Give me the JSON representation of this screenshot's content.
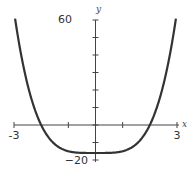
{
  "chart_data": {
    "type": "line",
    "title": "",
    "xlabel": "x",
    "ylabel": "y",
    "xlim": [
      -3,
      3
    ],
    "ylim": [
      -20,
      60
    ],
    "x_tick_labels": [
      "-3",
      "3"
    ],
    "y_tick_labels": [
      "60",
      "-20"
    ],
    "x_ticks": [
      -3,
      -1,
      1,
      3
    ],
    "y_ticks": [
      -20,
      -10,
      0,
      10,
      20,
      30,
      40,
      50,
      60
    ],
    "grid": false,
    "series": [
      {
        "name": "y = x^4 - 16",
        "x": [
          -2.9,
          -2.5,
          -2,
          -1.5,
          -1,
          -0.5,
          0,
          0.5,
          1,
          1.5,
          2,
          2.5,
          2.9
        ],
        "values": [
          54.7,
          23.1,
          0,
          -10.9,
          -15,
          -15.9,
          -16,
          -15.9,
          -15,
          -10.9,
          0,
          23.1,
          54.7
        ]
      }
    ],
    "color": "#333333"
  },
  "labels": {
    "x_min": "-3",
    "x_max": "3",
    "y_max": "60",
    "y_min": "−20",
    "x_axis": "x",
    "y_axis": "y"
  }
}
